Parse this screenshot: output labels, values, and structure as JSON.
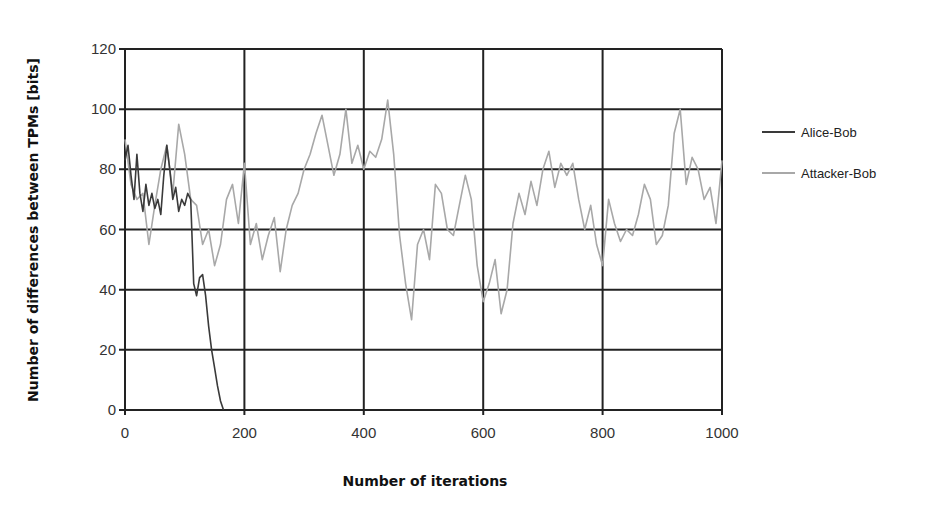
{
  "chart_data": {
    "type": "line",
    "title": "",
    "xlabel": "Number of iterations",
    "ylabel": "Number of differences between TPMs [bits]",
    "xlim": [
      0,
      1000
    ],
    "ylim": [
      0,
      120
    ],
    "x_ticks": [
      0,
      200,
      400,
      600,
      800,
      1000
    ],
    "y_ticks": [
      0,
      20,
      40,
      60,
      80,
      100,
      120
    ],
    "grid": true,
    "legend_position": "right",
    "series": [
      {
        "name": "Alice-Bob",
        "color": "#3a3a3a",
        "x": [
          0,
          5,
          10,
          15,
          20,
          25,
          30,
          35,
          40,
          45,
          50,
          55,
          60,
          65,
          70,
          75,
          80,
          85,
          90,
          95,
          100,
          105,
          110,
          115,
          120,
          125,
          130,
          135,
          140,
          145,
          150,
          155,
          160,
          165
        ],
        "y": [
          83,
          88,
          78,
          70,
          85,
          72,
          66,
          75,
          68,
          72,
          67,
          70,
          65,
          78,
          88,
          80,
          70,
          74,
          66,
          70,
          68,
          72,
          70,
          42,
          38,
          44,
          45,
          38,
          28,
          20,
          14,
          8,
          3,
          0
        ]
      },
      {
        "name": "Attacker-Bob",
        "color": "#a8a8a8",
        "x": [
          0,
          10,
          20,
          30,
          40,
          50,
          60,
          70,
          80,
          90,
          100,
          110,
          120,
          130,
          140,
          150,
          160,
          170,
          180,
          190,
          200,
          210,
          220,
          230,
          240,
          250,
          260,
          270,
          280,
          290,
          300,
          310,
          320,
          330,
          340,
          350,
          360,
          370,
          380,
          390,
          400,
          410,
          420,
          430,
          440,
          450,
          460,
          470,
          480,
          490,
          500,
          510,
          520,
          530,
          540,
          550,
          560,
          570,
          580,
          590,
          600,
          610,
          620,
          630,
          640,
          650,
          660,
          670,
          680,
          690,
          700,
          710,
          720,
          730,
          740,
          750,
          760,
          770,
          780,
          790,
          800,
          810,
          820,
          830,
          840,
          850,
          860,
          870,
          880,
          890,
          900,
          910,
          920,
          930,
          940,
          950,
          960,
          970,
          980,
          990,
          1000
        ],
        "y": [
          90,
          75,
          70,
          72,
          55,
          68,
          80,
          88,
          72,
          95,
          85,
          70,
          68,
          55,
          60,
          48,
          55,
          70,
          75,
          62,
          82,
          55,
          62,
          50,
          58,
          64,
          46,
          60,
          68,
          72,
          80,
          85,
          92,
          98,
          88,
          78,
          85,
          100,
          82,
          88,
          80,
          86,
          84,
          90,
          103,
          85,
          58,
          42,
          30,
          55,
          60,
          50,
          75,
          72,
          60,
          58,
          68,
          78,
          70,
          48,
          36,
          42,
          50,
          32,
          40,
          62,
          72,
          65,
          76,
          68,
          80,
          86,
          74,
          82,
          78,
          82,
          70,
          60,
          68,
          55,
          48,
          70,
          62,
          56,
          60,
          58,
          65,
          75,
          70,
          55,
          58,
          68,
          92,
          100,
          75,
          84,
          80,
          70,
          74,
          62,
          83
        ]
      }
    ]
  }
}
